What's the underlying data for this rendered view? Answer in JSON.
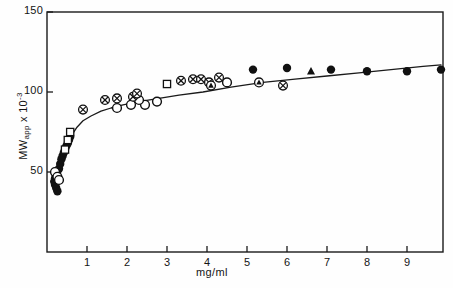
{
  "figure": {
    "caption_region_present": true
  },
  "chart_data": {
    "type": "scatter",
    "title": "",
    "subtitle": "",
    "xlabel": "mg/ml",
    "ylabel": "MWapp x 10-3",
    "ylabel_parts": {
      "main": "MW",
      "sub": "app",
      "times": " x 10",
      "sup": "-3"
    },
    "xlim": [
      0,
      9.9
    ],
    "ylim": [
      0,
      150
    ],
    "xticks": [
      1,
      2,
      3,
      4,
      5,
      6,
      7,
      8,
      9
    ],
    "xticklabels": [
      "1",
      "2",
      "3",
      "4",
      "5",
      "6",
      "7",
      "8",
      "9"
    ],
    "yticks": [
      50,
      100,
      150
    ],
    "yticklabels": [
      "50",
      "100",
      "150"
    ],
    "grid": false,
    "legend": "none",
    "frame": "full-box",
    "fit_curve": {
      "name": "saturation fit",
      "points": [
        [
          0.28,
          40
        ],
        [
          0.33,
          48
        ],
        [
          0.38,
          56
        ],
        [
          0.45,
          63
        ],
        [
          0.52,
          68
        ],
        [
          0.62,
          73
        ],
        [
          0.75,
          78
        ],
        [
          0.9,
          82
        ],
        [
          1.1,
          85
        ],
        [
          1.35,
          88
        ],
        [
          1.6,
          90
        ],
        [
          1.9,
          92
        ],
        [
          2.3,
          94
        ],
        [
          2.8,
          96
        ],
        [
          3.3,
          98
        ],
        [
          3.9,
          100
        ],
        [
          4.6,
          103
        ],
        [
          5.4,
          106
        ],
        [
          6.2,
          108
        ],
        [
          7.0,
          110
        ],
        [
          7.8,
          112
        ],
        [
          8.6,
          114
        ],
        [
          9.4,
          116
        ],
        [
          9.85,
          117
        ]
      ]
    },
    "series": [
      {
        "name": "filled-circle",
        "marker": "filled-circle",
        "points": [
          [
            0.18,
            44
          ],
          [
            0.2,
            46
          ],
          [
            0.22,
            48
          ],
          [
            0.24,
            50
          ],
          [
            0.2,
            42
          ],
          [
            0.23,
            40
          ],
          [
            0.26,
            38
          ],
          [
            0.3,
            52
          ],
          [
            0.33,
            55
          ],
          [
            0.36,
            58
          ],
          [
            0.39,
            60
          ],
          [
            0.42,
            62
          ],
          [
            0.45,
            64
          ],
          [
            0.48,
            66
          ],
          [
            0.52,
            68
          ],
          [
            0.55,
            70
          ],
          [
            0.58,
            72
          ],
          [
            5.15,
            114
          ],
          [
            6.0,
            115
          ],
          [
            7.1,
            114
          ],
          [
            8.0,
            113
          ],
          [
            9.0,
            113
          ],
          [
            9.85,
            114
          ]
        ]
      },
      {
        "name": "open-circle",
        "marker": "open-circle",
        "points": [
          [
            0.2,
            50
          ],
          [
            0.26,
            47
          ],
          [
            0.3,
            45
          ],
          [
            1.75,
            90
          ],
          [
            2.1,
            92
          ],
          [
            2.45,
            92
          ],
          [
            2.75,
            94
          ],
          [
            4.5,
            106
          ],
          [
            2.3,
            95
          ]
        ]
      },
      {
        "name": "circled-x",
        "marker": "circled-x",
        "points": [
          [
            0.9,
            89
          ],
          [
            1.45,
            95
          ],
          [
            1.75,
            96
          ],
          [
            2.15,
            97
          ],
          [
            2.25,
            99
          ],
          [
            3.35,
            107
          ],
          [
            3.65,
            108
          ],
          [
            3.85,
            108
          ],
          [
            4.3,
            109
          ],
          [
            4.05,
            106
          ],
          [
            5.9,
            104
          ]
        ]
      },
      {
        "name": "open-square",
        "marker": "open-square",
        "points": [
          [
            0.45,
            64
          ],
          [
            0.52,
            70
          ],
          [
            0.58,
            75
          ],
          [
            3.0,
            105
          ]
        ]
      },
      {
        "name": "circled-triangle",
        "marker": "circled-triangle",
        "points": [
          [
            4.1,
            104
          ],
          [
            5.3,
            106
          ]
        ]
      },
      {
        "name": "filled-triangle",
        "marker": "filled-triangle",
        "points": [
          [
            6.6,
            113
          ]
        ]
      }
    ]
  }
}
